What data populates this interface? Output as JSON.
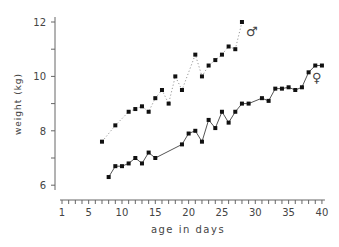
{
  "chart_data": {
    "type": "line",
    "title": "",
    "xlabel": "age in days",
    "ylabel": "weight (kg)",
    "xlim": [
      1,
      40
    ],
    "ylim": [
      6,
      12
    ],
    "x_ticks": [
      1,
      5,
      10,
      15,
      20,
      25,
      30,
      35,
      40
    ],
    "y_ticks": [
      6,
      8,
      10,
      12
    ],
    "grid": false,
    "series": [
      {
        "name": "male",
        "symbol": "♂",
        "style": "dotted",
        "x": [
          7,
          9,
          11,
          12,
          13,
          14,
          15,
          16,
          17,
          18,
          19,
          21,
          22,
          23,
          24,
          25,
          26,
          27,
          28
        ],
        "values": [
          7.6,
          8.2,
          8.7,
          8.8,
          8.9,
          8.7,
          9.2,
          9.5,
          9.0,
          10.0,
          9.5,
          10.8,
          10.0,
          10.4,
          10.6,
          10.8,
          11.1,
          11.0,
          12.0
        ]
      },
      {
        "name": "female",
        "symbol": "♀",
        "style": "solid",
        "x": [
          8,
          9,
          10,
          11,
          12,
          13,
          14,
          15,
          19,
          20,
          21,
          22,
          23,
          24,
          25,
          26,
          27,
          28,
          29,
          31,
          32,
          33,
          34,
          35,
          36,
          37,
          38,
          39,
          40
        ],
        "values": [
          6.3,
          6.7,
          6.7,
          6.8,
          7.0,
          6.8,
          7.2,
          7.0,
          7.5,
          7.9,
          8.0,
          7.6,
          8.4,
          8.1,
          8.7,
          8.3,
          8.7,
          9.0,
          9.0,
          9.2,
          9.1,
          9.55,
          9.55,
          9.6,
          9.5,
          9.6,
          10.15,
          10.4,
          10.4
        ]
      }
    ]
  },
  "labels": {
    "xlabel": "age in days",
    "ylabel": "weight (kg)",
    "male_symbol": "♂",
    "female_symbol": "♀"
  }
}
